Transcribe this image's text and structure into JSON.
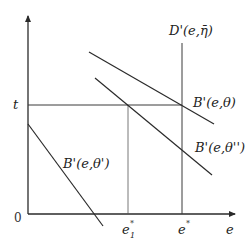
{
  "diagram": {
    "type": "economics-marginal-benefit-cost-diagram",
    "axes": {
      "x_label": "e",
      "y_label_tick": "t",
      "origin_label": "0"
    },
    "x_ticks": {
      "e1_star_base": "e",
      "e1_star_sub": "1",
      "e1_star_sup": "*",
      "e_star_base": "e",
      "e_star_sup": "*"
    },
    "curves": [
      {
        "id": "D-prime",
        "label": "D'(e,η̄)",
        "kind": "vertical"
      },
      {
        "id": "B-prime-theta",
        "label": "B'(e,θ)",
        "kind": "downward-sloping"
      },
      {
        "id": "B-prime-theta-double",
        "label": "B'(e,θ'')",
        "kind": "downward-sloping"
      },
      {
        "id": "B-prime-theta-single",
        "label": "B'(e,θ')",
        "kind": "downward-sloping"
      }
    ],
    "colors": {
      "line": "#2a2a2a",
      "background": "#ffffff"
    }
  }
}
